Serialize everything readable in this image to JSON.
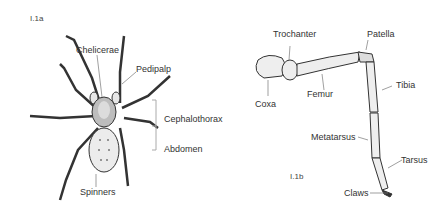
{
  "figures": {
    "a": {
      "id": "I.1a",
      "labels": {
        "chelicerae": "Chelicerae",
        "pedipalp": "Pedipalp",
        "cephalothorax": "Cephalothorax",
        "abdomen": "Abdomen",
        "spinners": "Spinners"
      }
    },
    "b": {
      "id": "I.1b",
      "labels": {
        "trochanter": "Trochanter",
        "patella": "Patella",
        "coxa": "Coxa",
        "femur": "Femur",
        "tibia": "Tibia",
        "metatarsus": "Metatarsus",
        "tarsus": "Tarsus",
        "claws": "Claws"
      }
    }
  },
  "colors": {
    "ink": "#333333",
    "leader": "#777777",
    "bracket": "#aaaaaa",
    "fill": "#e8e8e8"
  }
}
